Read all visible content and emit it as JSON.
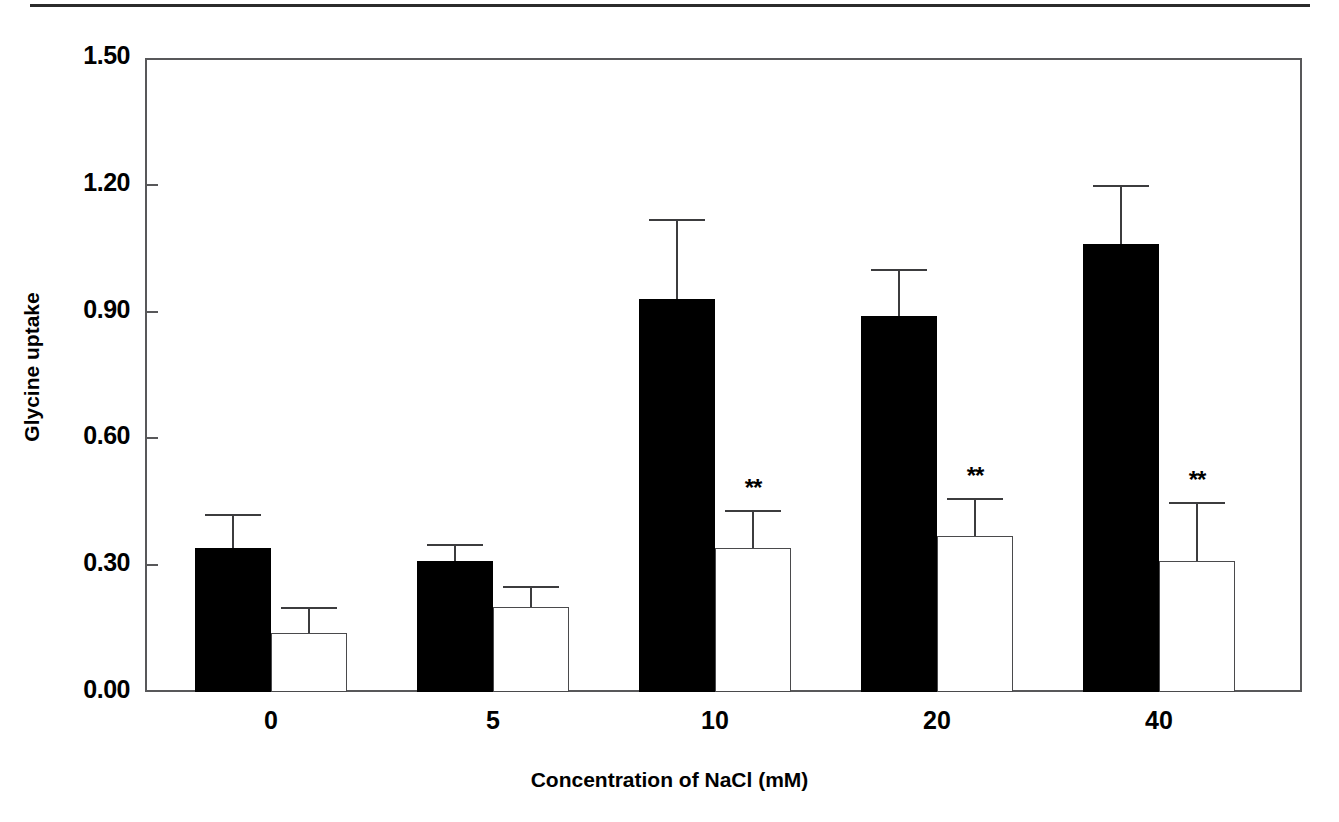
{
  "chart_data": {
    "type": "bar",
    "title": "",
    "subtitle": "",
    "xlabel": "Concentration of NaCl (mM)",
    "ylabel": "Glycine uptake",
    "categories": [
      "0",
      "5",
      "10",
      "20",
      "40"
    ],
    "ylim": [
      0.0,
      1.5
    ],
    "yticks": [
      "0.00",
      "0.30",
      "0.60",
      "0.90",
      "1.20",
      "1.50"
    ],
    "ytick_values": [
      0.0,
      0.3,
      0.6,
      0.9,
      1.2,
      1.5
    ],
    "grid": false,
    "legend": "none",
    "series": [
      {
        "name": "filled",
        "style": "filled-black",
        "values": [
          0.34,
          0.31,
          0.93,
          0.89,
          1.06
        ],
        "errors_upper": [
          0.42,
          0.35,
          1.12,
          1.0,
          1.2
        ],
        "annotations": [
          "",
          "",
          "",
          "",
          ""
        ]
      },
      {
        "name": "open",
        "style": "open-white",
        "values": [
          0.14,
          0.2,
          0.34,
          0.37,
          0.31
        ],
        "errors_upper": [
          0.2,
          0.25,
          0.43,
          0.46,
          0.45
        ],
        "annotations": [
          "",
          "",
          "**",
          "**",
          "**"
        ]
      }
    ]
  },
  "axes": {
    "y_title": "Glycine uptake",
    "x_title": "Concentration of NaCl (mM)"
  },
  "colors": {
    "filled_bar": "#000000",
    "open_bar_border": "#4a4a4c",
    "axis": "#58585a",
    "text": "#000000",
    "background": "#ffffff",
    "top_rule": "#2b2b2b"
  }
}
